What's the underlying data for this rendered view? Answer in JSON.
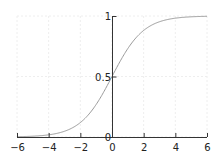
{
  "chart_data": {
    "type": "line",
    "title": "",
    "xlabel": "",
    "ylabel": "",
    "xlim": [
      -6,
      6
    ],
    "ylim": [
      0,
      1
    ],
    "grid": true,
    "x_ticks": [
      -6,
      -4,
      -2,
      0,
      2,
      4,
      6
    ],
    "x_tick_labels": [
      "−6",
      "−4",
      "−2",
      "0",
      "2",
      "4",
      "6"
    ],
    "y_ticks": [
      0,
      0.5,
      1
    ],
    "y_tick_labels": [
      "0",
      "0.5",
      "1"
    ],
    "series": [
      {
        "name": "sigmoid",
        "function": "1/(1+exp(-x))",
        "x": [
          -6,
          -5,
          -4,
          -3,
          -2,
          -1,
          0,
          1,
          2,
          3,
          4,
          5,
          6
        ],
        "values": [
          0.0025,
          0.0067,
          0.018,
          0.047,
          0.119,
          0.269,
          0.5,
          0.731,
          0.881,
          0.953,
          0.982,
          0.9933,
          0.9975
        ],
        "color": "#999999"
      }
    ],
    "colors": {
      "axis": "#333333",
      "grid": "#eeeeee",
      "curve": "#9a9a9a"
    }
  }
}
